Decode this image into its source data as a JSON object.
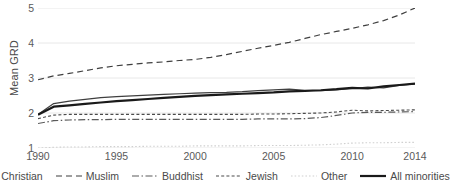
{
  "chart_data": {
    "type": "line",
    "title": "",
    "xlabel": "",
    "ylabel": "Mean GRD",
    "xlim": [
      1990,
      2014
    ],
    "ylim": [
      1,
      5
    ],
    "grid": true,
    "legend_position": "bottom",
    "x": [
      1990,
      1991,
      1992,
      1993,
      1994,
      1995,
      1996,
      1997,
      1998,
      1999,
      2000,
      2001,
      2002,
      2003,
      2004,
      2005,
      2006,
      2007,
      2008,
      2009,
      2010,
      2011,
      2012,
      2013,
      2014
    ],
    "y_ticks": [
      "1",
      "2",
      "3",
      "4",
      "5"
    ],
    "x_ticks": [
      "1990",
      "1995",
      "2000",
      "2005",
      "2010",
      "2014"
    ],
    "series": [
      {
        "name": "Christian",
        "style": "solid-thin",
        "color": "#3f3f3f",
        "values": [
          1.96,
          2.27,
          2.34,
          2.39,
          2.44,
          2.47,
          2.49,
          2.51,
          2.53,
          2.55,
          2.57,
          2.58,
          2.59,
          2.61,
          2.64,
          2.66,
          2.68,
          2.65,
          2.64,
          2.66,
          2.7,
          2.74,
          2.72,
          2.79,
          2.83
        ]
      },
      {
        "name": "Muslim",
        "style": "dashed-long",
        "color": "#3f3f3f",
        "values": [
          2.95,
          3.06,
          3.13,
          3.21,
          3.29,
          3.35,
          3.39,
          3.43,
          3.46,
          3.5,
          3.53,
          3.59,
          3.67,
          3.76,
          3.85,
          3.93,
          4.02,
          4.13,
          4.24,
          4.33,
          4.42,
          4.52,
          4.64,
          4.8,
          5.0
        ]
      },
      {
        "name": "Buddhist",
        "style": "dash-dot",
        "color": "#5a5a5a",
        "values": [
          1.7,
          1.78,
          1.8,
          1.81,
          1.81,
          1.82,
          1.82,
          1.82,
          1.82,
          1.82,
          1.82,
          1.82,
          1.82,
          1.82,
          1.83,
          1.83,
          1.83,
          1.84,
          1.87,
          1.93,
          2.0,
          2.02,
          2.02,
          2.03,
          2.04
        ]
      },
      {
        "name": "Jewish",
        "style": "dashed-short",
        "color": "#4a4a4a",
        "values": [
          1.84,
          1.94,
          1.96,
          1.96,
          1.96,
          1.96,
          1.96,
          1.96,
          1.96,
          1.96,
          1.96,
          1.96,
          1.96,
          1.96,
          1.97,
          1.97,
          1.98,
          1.99,
          2.0,
          2.03,
          2.08,
          2.06,
          2.07,
          2.08,
          2.09
        ]
      },
      {
        "name": "Other",
        "style": "dotted",
        "color": "#d0d0d0",
        "values": [
          1.0,
          1.02,
          1.03,
          1.03,
          1.04,
          1.04,
          1.04,
          1.05,
          1.05,
          1.05,
          1.06,
          1.06,
          1.06,
          1.06,
          1.07,
          1.07,
          1.07,
          1.08,
          1.09,
          1.11,
          1.14,
          1.15,
          1.15,
          1.16,
          1.16
        ]
      },
      {
        "name": "All minorities",
        "style": "solid-thick",
        "color": "#1a1a1a",
        "values": [
          1.95,
          2.18,
          2.22,
          2.26,
          2.3,
          2.34,
          2.37,
          2.4,
          2.43,
          2.46,
          2.49,
          2.51,
          2.53,
          2.55,
          2.57,
          2.59,
          2.62,
          2.63,
          2.65,
          2.68,
          2.72,
          2.7,
          2.76,
          2.8,
          2.84
        ]
      }
    ]
  }
}
